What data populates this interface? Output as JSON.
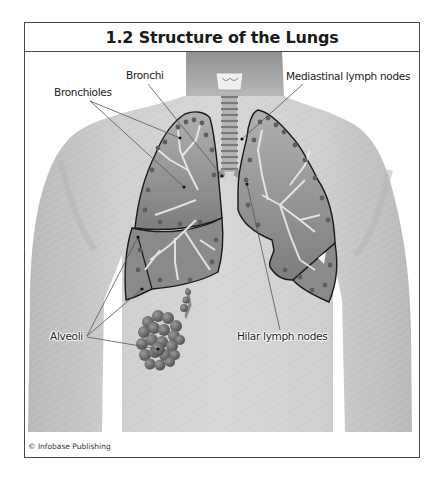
{
  "figure": {
    "title": "1.2 Structure of the Lungs",
    "credit": "© Infobase Publishing"
  },
  "labels": {
    "bronchi": "Bronchi",
    "bronchioles": "Bronchioles",
    "mediastinal_lymph_nodes": "Mediastinal lymph nodes",
    "alveoli": "Alveoli",
    "hilar_lymph_nodes": "Hilar lymph nodes"
  },
  "colors": {
    "frame_border": "#4a4a4a",
    "skin": "#c9c9c9",
    "skin_shadow": "#a9a9a9",
    "lung_fill": "#8e8e8e",
    "lung_outline": "#1a1a1a",
    "airway": "#e8e8e8",
    "alveoli": "#6f6f6f",
    "leader_line": "#555555"
  },
  "illustration": {
    "subject": "human torso with lungs",
    "structures": [
      "larynx",
      "trachea",
      "left-lung-upper-lobe",
      "left-lung-lower-lobe",
      "right-lung-upper-lobe",
      "right-lung-lower-lobe",
      "alveolar-sac"
    ]
  }
}
